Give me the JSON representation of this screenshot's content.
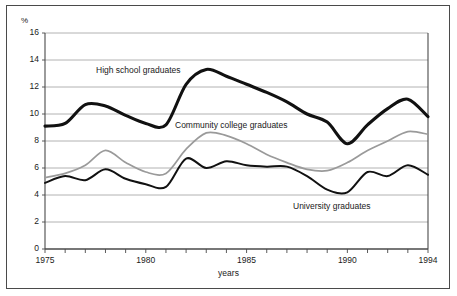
{
  "chart_data": {
    "type": "line",
    "title": "",
    "subtitle": "",
    "xlabel": "years",
    "ylabel": "%",
    "ylim": [
      0,
      16
    ],
    "xlim": [
      1975,
      1994
    ],
    "ytick_labels": [
      "16",
      "14",
      "12",
      "10",
      "8",
      "6",
      "4",
      "2",
      "0"
    ],
    "ytick_values": [
      16,
      14,
      12,
      10,
      8,
      6,
      4,
      2,
      0
    ],
    "xtick_labels": [
      "1975",
      "1980",
      "1985",
      "1990",
      "1994"
    ],
    "xtick_values": [
      1975,
      1980,
      1985,
      1990,
      1994
    ],
    "minor_xticks_every": 1,
    "grid": "horizontal",
    "legend_position": "inline-annotations",
    "x": [
      1975,
      1976,
      1977,
      1978,
      1979,
      1980,
      1981,
      1982,
      1983,
      1984,
      1985,
      1986,
      1987,
      1988,
      1989,
      1990,
      1991,
      1992,
      1993,
      1994
    ],
    "series": [
      {
        "name": "High school graduates",
        "color": "#111111",
        "width": 3.1,
        "values": [
          9.1,
          9.3,
          10.7,
          10.6,
          9.9,
          9.3,
          9.2,
          12.2,
          13.3,
          12.8,
          12.2,
          11.6,
          10.9,
          10.0,
          9.4,
          7.8,
          9.2,
          10.4,
          11.1,
          9.8
        ]
      },
      {
        "name": "Community college graduates",
        "color": "#9a9a9a",
        "width": 1.7,
        "values": [
          5.3,
          5.6,
          6.2,
          7.3,
          6.4,
          5.7,
          5.6,
          7.4,
          8.6,
          8.4,
          7.8,
          7.0,
          6.4,
          5.9,
          5.8,
          6.4,
          7.3,
          8.0,
          8.7,
          8.5
        ]
      },
      {
        "name": "University graduates",
        "color": "#111111",
        "width": 2.0,
        "values": [
          4.9,
          5.4,
          5.1,
          5.9,
          5.2,
          4.8,
          4.6,
          6.7,
          6.0,
          6.5,
          6.2,
          6.1,
          6.1,
          5.4,
          4.4,
          4.2,
          5.7,
          5.4,
          6.2,
          5.5
        ]
      }
    ],
    "annotations": [
      {
        "text": "High school graduates",
        "x": 1977.6,
        "y": 13.9
      },
      {
        "text": "Community college graduates",
        "x": 1981.5,
        "y": 9.6
      },
      {
        "text": "University graduates",
        "x": 1987.5,
        "y": 3.4
      }
    ]
  },
  "axes": {
    "y_unit_label": "%",
    "x_title": "years"
  }
}
